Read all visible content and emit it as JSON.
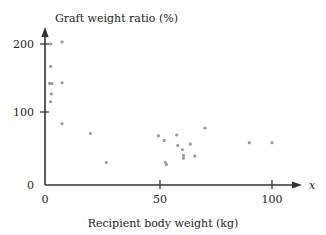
{
  "chart_data": {
    "type": "scatter",
    "title": "",
    "ylabel": "Graft weight ratio (%)",
    "xlabel": "Recipient body weight (kg)",
    "x_axis_variable": "x",
    "xlim": [
      0,
      110
    ],
    "ylim": [
      0,
      215
    ],
    "xticks": [
      0,
      50,
      100
    ],
    "xtick_labels": [
      "0",
      "50",
      "100"
    ],
    "yticks": [
      0,
      100,
      200
    ],
    "ytick_labels": [
      "0",
      "100",
      "200"
    ],
    "grid": false,
    "legend": false,
    "point_color": "#9a9a9a",
    "axis_color": "#333333",
    "background_color": "#ffffff",
    "series": [
      {
        "name": "Liver graft recipients",
        "points": [
          {
            "x": 2.5,
            "y": 200
          },
          {
            "x": 7.5,
            "y": 203
          },
          {
            "x": 2.5,
            "y": 168
          },
          {
            "x": 2.0,
            "y": 144
          },
          {
            "x": 3.0,
            "y": 144
          },
          {
            "x": 7.5,
            "y": 145
          },
          {
            "x": 2.8,
            "y": 129
          },
          {
            "x": 2.4,
            "y": 118
          },
          {
            "x": 7.5,
            "y": 87
          },
          {
            "x": 20.0,
            "y": 73
          },
          {
            "x": 27.0,
            "y": 32
          },
          {
            "x": 50.0,
            "y": 70
          },
          {
            "x": 52.5,
            "y": 63
          },
          {
            "x": 53.0,
            "y": 32
          },
          {
            "x": 53.5,
            "y": 29
          },
          {
            "x": 58.0,
            "y": 71
          },
          {
            "x": 58.5,
            "y": 56
          },
          {
            "x": 60.5,
            "y": 50
          },
          {
            "x": 61.0,
            "y": 42
          },
          {
            "x": 61.0,
            "y": 38
          },
          {
            "x": 64.0,
            "y": 58
          },
          {
            "x": 66.0,
            "y": 41
          },
          {
            "x": 70.5,
            "y": 81
          },
          {
            "x": 90.0,
            "y": 60
          },
          {
            "x": 100.0,
            "y": 60
          }
        ]
      }
    ]
  },
  "figure": {
    "caption": ""
  }
}
